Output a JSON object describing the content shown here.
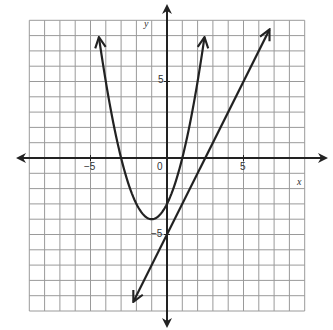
{
  "chart_data": {
    "type": "line",
    "title": "",
    "xlabel": "x",
    "ylabel": "y",
    "xlim": [
      -9,
      9
    ],
    "ylim": [
      -10,
      9
    ],
    "grid": true,
    "grid_step": 1,
    "x_ticks": [
      {
        "value": -5,
        "label": "-5"
      },
      {
        "value": 0,
        "label": "0"
      },
      {
        "value": 5,
        "label": "5"
      }
    ],
    "y_ticks": [
      {
        "value": 5,
        "label": "5"
      },
      {
        "value": -5,
        "label": "-5"
      }
    ],
    "series": [
      {
        "name": "parabola",
        "equation": "y = (x + 1)^2 - 4",
        "vertex": [
          -1,
          -4
        ],
        "x_intercepts": [
          -3,
          1
        ],
        "y_intercept": -3,
        "x_range": [
          -4.45,
          2.45
        ],
        "arrows": "both-ends-up"
      },
      {
        "name": "line",
        "equation": "y = 2x - 5",
        "slope": 2,
        "y_intercept": -5,
        "x_intercept": 2.5,
        "x_range": [
          -2.2,
          6.7
        ],
        "arrows": "both-ends"
      }
    ]
  },
  "labels": {
    "x_axis": "x",
    "y_axis": "y",
    "tick_neg5_x": "−5",
    "tick_0": "0",
    "tick_5_x": "5",
    "tick_5_y": "5",
    "tick_neg5_y": "−5"
  },
  "colors": {
    "grid": "#9a9a9a",
    "axis": "#222222",
    "curve": "#222222"
  }
}
